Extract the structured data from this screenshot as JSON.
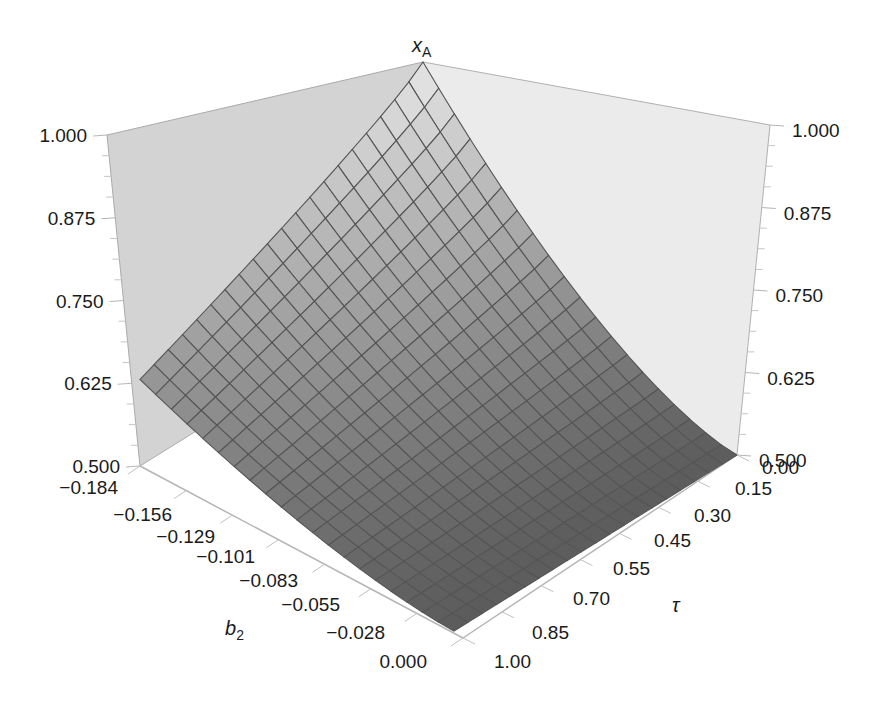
{
  "chart_data": {
    "type": "surface3d",
    "title": "",
    "zlabel": "x_A",
    "zlabel_main": "x",
    "zlabel_sub": "A",
    "xlabel": "b_2",
    "xlabel_main": "b",
    "xlabel_sub": "2",
    "ylabel": "τ",
    "z_ticks": [
      "0.500",
      "0.625",
      "0.750",
      "0.875",
      "1.000"
    ],
    "zlim": [
      0.5,
      1.0
    ],
    "b2_ticks": [
      "−0.184",
      "−0.156",
      "−0.129",
      "−0.101",
      "−0.083",
      "−0.055",
      "−0.028",
      "0.000"
    ],
    "b2_range": [
      -0.184,
      0.0
    ],
    "tau_ticks": [
      "0.00",
      "0.15",
      "0.30",
      "0.45",
      "0.55",
      "0.70",
      "0.85",
      "1.00"
    ],
    "tau_range": [
      0.0,
      1.0
    ],
    "grid_divisions": 20,
    "corner_values": {
      "b2_min_tau_0": 1.0,
      "b2_min_tau_1": 0.69,
      "b2_max_tau_0": 0.5,
      "b2_max_tau_1": 0.5
    },
    "colors": {
      "surface_light": "#e6e6e6",
      "surface_dark": "#5c5c5c",
      "mesh": "#555555",
      "wall_left": "#d2d2d2",
      "wall_right": "#e9e9e9",
      "axis_line": "#b5b5b5"
    }
  }
}
